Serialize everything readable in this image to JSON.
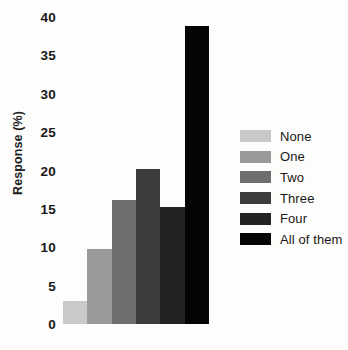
{
  "chart_data": {
    "type": "bar",
    "title": "",
    "subtitle": "",
    "xlabel": "",
    "ylabel": "Response (%)",
    "categories": [
      "None",
      "One",
      "Two",
      "Three",
      "Four",
      "All of them"
    ],
    "values": [
      3.0,
      9.8,
      16.1,
      20.2,
      15.2,
      38.8
    ],
    "series": [
      {
        "name": "Response",
        "values": [
          3.0,
          9.8,
          16.1,
          20.2,
          15.2,
          38.8
        ]
      }
    ],
    "ylim": [
      0,
      40
    ],
    "yticks": [
      0,
      5,
      10,
      15,
      20,
      25,
      30,
      35,
      40
    ],
    "ytick_labels": [
      "0",
      "5",
      "10",
      "15",
      "20",
      "25",
      "30",
      "35",
      "40"
    ],
    "grid": false,
    "legend_position": "right",
    "bar_colors": [
      "#c9c9c9",
      "#9a9a9a",
      "#6e6e6e",
      "#3c3c3c",
      "#232323",
      "#050505"
    ],
    "background_color": "#fdfdfc",
    "text_color": "#1b1717"
  },
  "legend": {
    "items": [
      {
        "label": "None",
        "color": "#c9c9c9"
      },
      {
        "label": "One",
        "color": "#9a9a9a"
      },
      {
        "label": "Two",
        "color": "#6e6e6e"
      },
      {
        "label": "Three",
        "color": "#3c3c3c"
      },
      {
        "label": "Four",
        "color": "#232323"
      },
      {
        "label": "All of them",
        "color": "#050505"
      }
    ]
  }
}
